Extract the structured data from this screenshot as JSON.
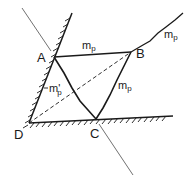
{
  "diagram": {
    "type": "mechanism-yield-line",
    "points": {
      "A": {
        "label": "A",
        "x": 54,
        "y": 57
      },
      "B": {
        "label": "B",
        "x": 131,
        "y": 52
      },
      "C": {
        "label": "C",
        "x": 96,
        "y": 119
      },
      "D": {
        "label": "D",
        "x": 29,
        "y": 123
      }
    },
    "labels": {
      "mp_top": "m",
      "mp_top_sub": "p",
      "mp_right": "m",
      "mp_right_sub": "p",
      "mp_bc": "m",
      "mp_bc_sub": "p",
      "mp_left": "m'",
      "mp_left_sub": "p"
    },
    "colors": {
      "line": "#1a1a1a",
      "thin_line": "#333333",
      "background": "#ffffff"
    }
  }
}
